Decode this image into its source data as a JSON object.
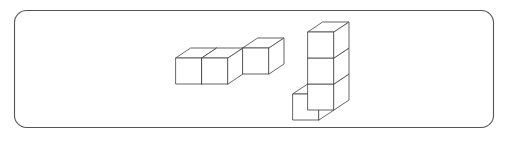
{
  "figure": {
    "background_color": "#ffffff",
    "panel": {
      "name": "rounded-rectangle-frame",
      "x": 14,
      "y": 10,
      "width": 480,
      "height": 118,
      "corner_radius": 12,
      "stroke_color": "#555555",
      "fill": "none"
    },
    "cube_style": {
      "face_fill": "#ffffff",
      "edge_color": "#4a4a4a",
      "edge_width": 0.85
    },
    "projection": {
      "type": "isometric",
      "cube_size": 26,
      "depth_dx": 15,
      "depth_dy": -10
    },
    "shapes": [
      {
        "name": "left-cube-group",
        "label": "zigzag of three cubes lying flat",
        "cube_count": 3,
        "origin": {
          "x": 176,
          "y": 84
        },
        "cubes": [
          {
            "id": "left-front-a",
            "col": 0,
            "row": 0,
            "layer": 0
          },
          {
            "id": "left-front-b",
            "col": 1,
            "row": 0,
            "layer": 0
          },
          {
            "id": "left-back-c",
            "col": 2,
            "row": 1,
            "layer": 0
          }
        ]
      },
      {
        "name": "right-cube-group",
        "label": "vertical stack of three cubes with one cube attached at front bottom",
        "cube_count": 4,
        "origin": {
          "x": 308,
          "y": 110
        },
        "cubes": [
          {
            "id": "stack-bottom",
            "col": 0,
            "row": 0,
            "layer": 0
          },
          {
            "id": "stack-middle",
            "col": 0,
            "row": 0,
            "layer": 1
          },
          {
            "id": "stack-top",
            "col": 0,
            "row": 0,
            "layer": 2
          },
          {
            "id": "front-attached",
            "col": 0,
            "row": -1,
            "layer": 0
          }
        ]
      }
    ]
  }
}
